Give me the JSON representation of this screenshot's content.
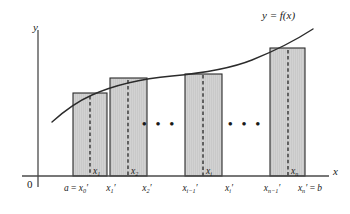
{
  "figure": {
    "curve_label": "y = f(x)",
    "y_axis_label": "y",
    "x_axis_label": "x",
    "origin_label": "0",
    "ellipsis": "• • •",
    "colors": {
      "rect_fill": "#c9c9c9",
      "rect_stroke": "#2b2b2b",
      "curve": "#2b2b2b",
      "axis": "#4a4a4a",
      "dashed": "#1a1a1a",
      "text": "#1a1a1a"
    },
    "axis_ticks": [
      {
        "id": "a-x0",
        "html": "a <span class=\"op\">=</span> x<sub>0</sub>′",
        "x": 76
      },
      {
        "id": "x1",
        "html": "x<sub>1</sub>′",
        "x": 111
      },
      {
        "id": "x2",
        "html": "x<sub>2</sub>′",
        "x": 147
      },
      {
        "id": "xi-1",
        "html": "x<sub>i−1</sub>′",
        "x": 190
      },
      {
        "id": "xi",
        "html": "x<sub>i</sub>′",
        "x": 229
      },
      {
        "id": "xn-1",
        "html": "x<sub>n−1</sub>′",
        "x": 272
      },
      {
        "id": "xn-b",
        "html": "x<sub>n</sub>′ <span class=\"op\">=</span> b",
        "x": 310
      }
    ],
    "sample_labels": [
      {
        "id": "x1-star",
        "html": "x<sub>1</sub>",
        "x": 93,
        "y": 167
      },
      {
        "id": "x2-star",
        "html": "x<sub>2</sub>",
        "x": 131,
        "y": 167
      },
      {
        "id": "xi-star",
        "html": "x<sub>i</sub>",
        "x": 206,
        "y": 167
      },
      {
        "id": "xn-star",
        "html": "x<sub>n</sub>",
        "x": 291,
        "y": 167
      }
    ],
    "ellipsis_groups": [
      {
        "id": "ellipsis-left",
        "x": 155,
        "y": 125
      },
      {
        "id": "ellipsis-right",
        "x": 230,
        "y": 125
      }
    ]
  },
  "chart_data": {
    "type": "area",
    "title": "",
    "xlabel": "x",
    "ylabel": "y",
    "grid": false,
    "legend": null,
    "axes": {
      "y_axis_px_x": 38,
      "x_axis_px_y": 176,
      "x_axis_px_end": 329,
      "y_axis_px_top": 30
    },
    "curve": {
      "label": "y = f(x)",
      "description": "increasing concave function",
      "points_px": [
        [
          52,
          122
        ],
        [
          70,
          107
        ],
        [
          90,
          96
        ],
        [
          110,
          88
        ],
        [
          135,
          81
        ],
        [
          165,
          77
        ],
        [
          195,
          74
        ],
        [
          225,
          70
        ],
        [
          250,
          63
        ],
        [
          270,
          54
        ],
        [
          285,
          46
        ],
        [
          300,
          38
        ],
        [
          312,
          30
        ]
      ]
    },
    "rectangles": [
      {
        "name": "rect-1",
        "left_px": 73,
        "right_px": 107,
        "top_px": 93,
        "sample_x_px": 90,
        "label": "x′1"
      },
      {
        "name": "rect-2",
        "left_px": 110,
        "right_px": 147,
        "top_px": 78,
        "sample_x_px": 128,
        "label": "x′2"
      },
      {
        "name": "rect-i",
        "left_px": 185,
        "right_px": 222,
        "top_px": 74,
        "sample_x_px": 203,
        "label": "x′i"
      },
      {
        "name": "rect-n",
        "left_px": 270,
        "right_px": 305,
        "top_px": 48,
        "sample_x_px": 288,
        "label": "x′n"
      }
    ],
    "partition_points_px": [
      76,
      111,
      147,
      190,
      229,
      272,
      310
    ]
  }
}
